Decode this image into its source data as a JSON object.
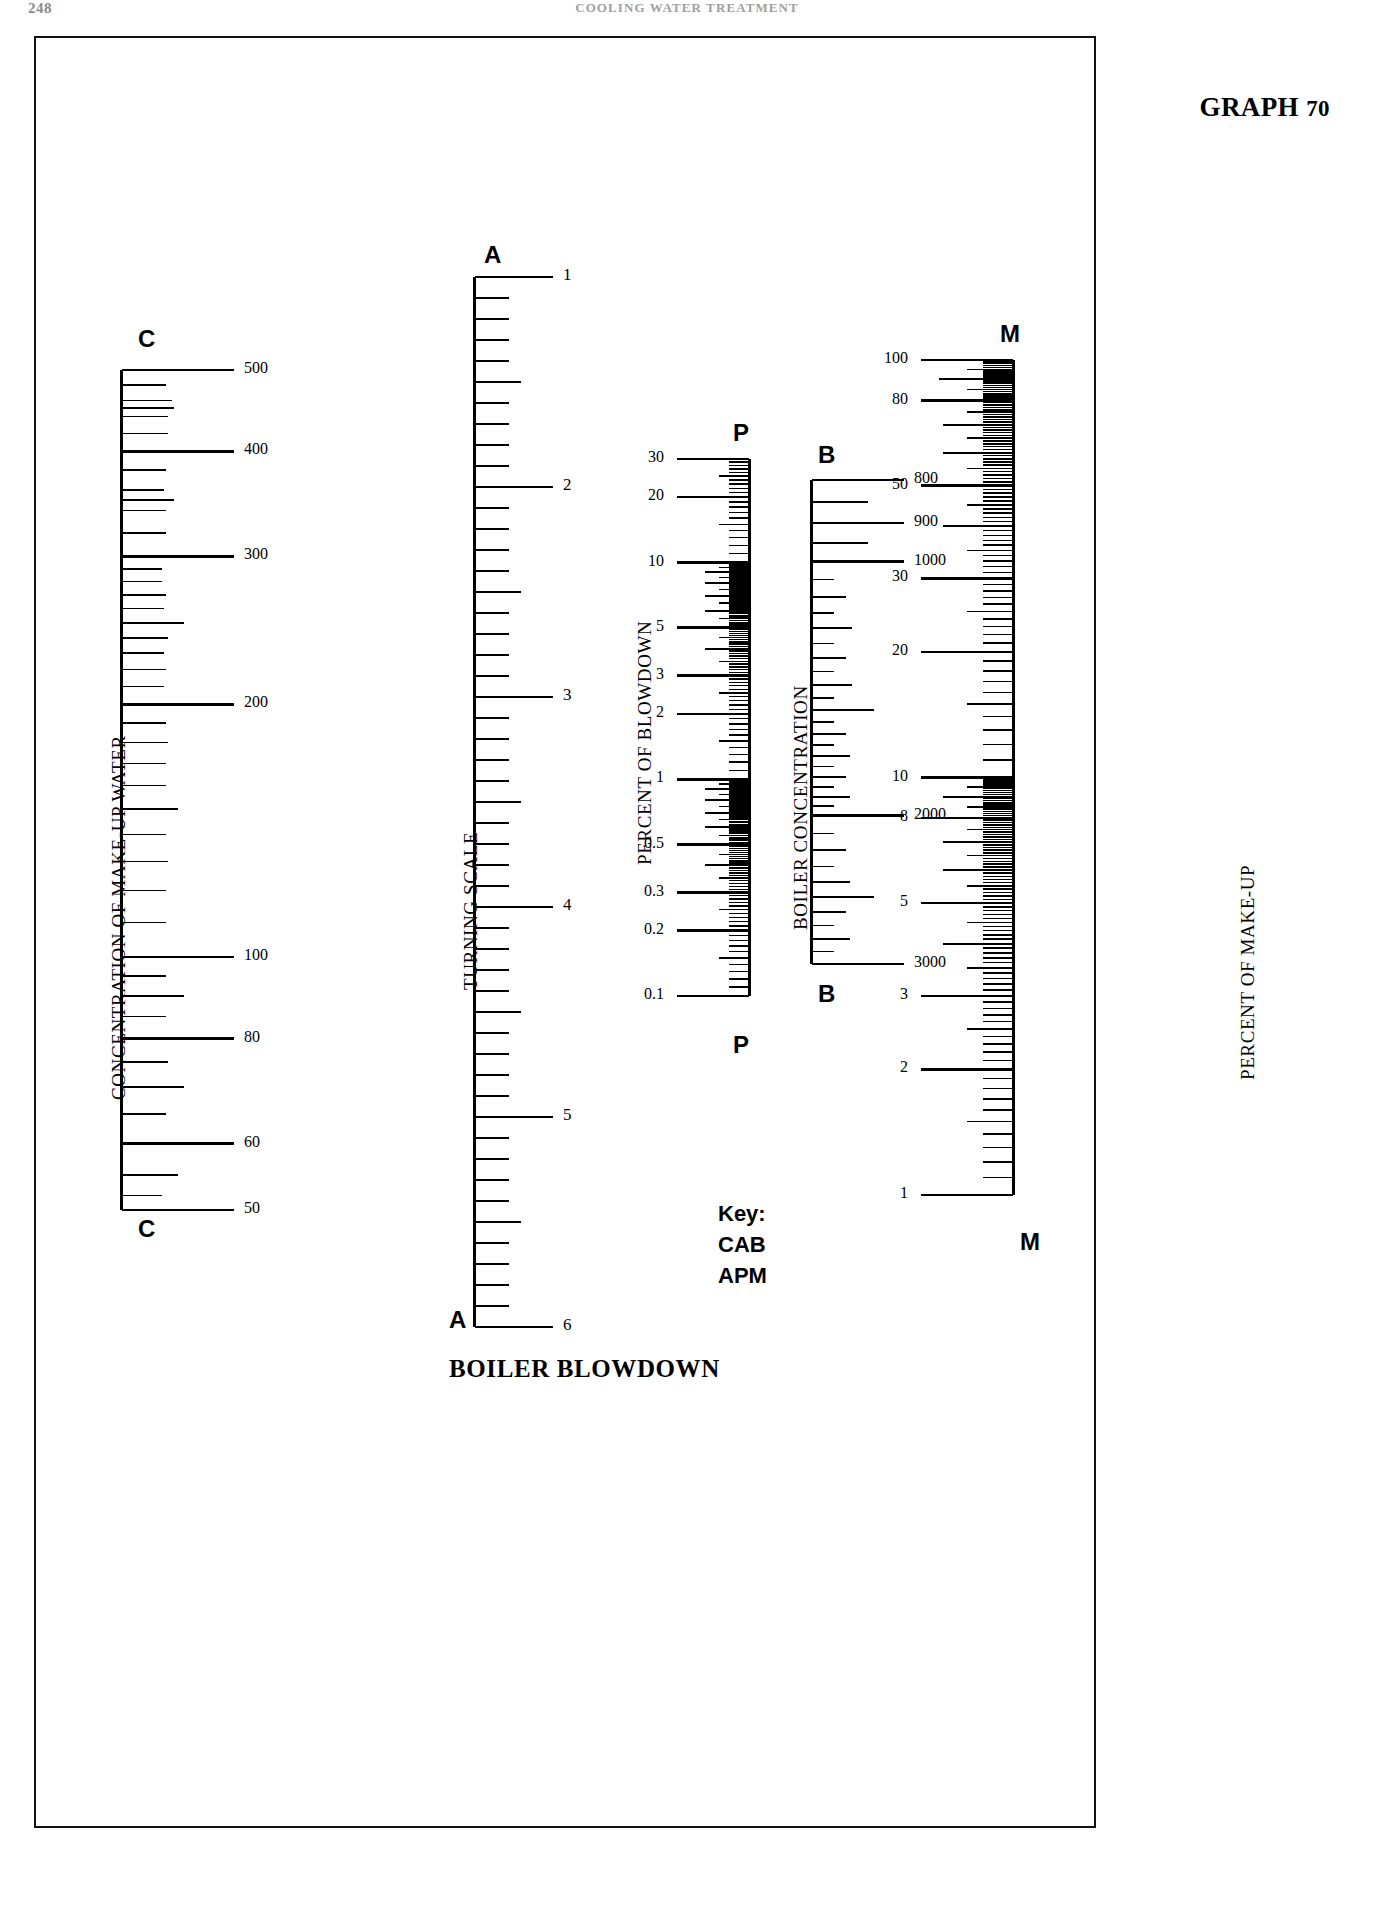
{
  "page": {
    "folio": "248",
    "running_head": "COOLING WATER TREATMENT",
    "graph_label": "GRAPH",
    "graph_number": "70",
    "bottom_title": "BOILER BLOWDOWN",
    "background": "#ffffff",
    "ink": "#000000"
  },
  "key": {
    "title": "Key:",
    "lines": [
      "CAB",
      "APM"
    ]
  },
  "chart_data": {
    "type": "nomogram",
    "subtitle": "Alignment nomogram: C–A–B  and  A–P–M",
    "grid": false,
    "legend_position": "bottom-center",
    "axes": [
      {
        "id": "C",
        "name": "C",
        "axis_label": "CONCENTRATION OF MAKE-UP WATER",
        "top_cap": "C",
        "bottom_cap": "C",
        "scale": "log",
        "direction": "decreasing-downward",
        "range": [
          500,
          50
        ],
        "labels_side": "right",
        "tick_labels": [
          "500",
          "400",
          "300",
          "200",
          "100",
          "80",
          "60",
          "50"
        ],
        "tick_values": [
          500,
          400,
          300,
          200,
          100,
          80,
          60,
          50
        ]
      },
      {
        "id": "A",
        "name": "A",
        "axis_label": "TURNING SCALE",
        "top_cap": "A",
        "bottom_cap": "A",
        "scale": "linear-index",
        "direction": "increasing-downward",
        "range": [
          1,
          6
        ],
        "labels_side": "right",
        "tick_labels": [
          "1",
          "2",
          "3",
          "4",
          "5",
          "6"
        ],
        "tick_values": [
          1,
          2,
          3,
          4,
          5,
          6
        ]
      },
      {
        "id": "P",
        "name": "P",
        "axis_label": "PERCENT OF BLOWDOWN",
        "top_cap": "P",
        "bottom_cap": "P",
        "scale": "log",
        "direction": "decreasing-downward",
        "range": [
          30,
          0.1
        ],
        "labels_side": "left",
        "tick_labels": [
          "30",
          "20",
          "10",
          "5",
          "3",
          "2",
          "1",
          "0.5",
          "0.3",
          "0.2",
          "0.1"
        ],
        "tick_values": [
          30,
          20,
          10,
          5,
          3,
          2,
          1,
          0.5,
          0.3,
          0.2,
          0.1
        ]
      },
      {
        "id": "B",
        "name": "B",
        "axis_label": "BOILER  CONCENTRATION",
        "top_cap": "B",
        "bottom_cap": "B",
        "scale": "log",
        "direction": "increasing-downward",
        "range": [
          800,
          3000
        ],
        "labels_side": "right",
        "tick_labels": [
          "800",
          "900",
          "1000",
          "2000",
          "3000"
        ],
        "tick_values": [
          800,
          900,
          1000,
          2000,
          3000
        ]
      },
      {
        "id": "M",
        "name": "M",
        "axis_label": "PERCENT OF MAKE-UP",
        "top_cap": "M",
        "bottom_cap": "M",
        "scale": "log",
        "direction": "decreasing-downward",
        "range": [
          100,
          1
        ],
        "labels_side": "left",
        "tick_labels": [
          "100",
          "80",
          "50",
          "30",
          "20",
          "10",
          "8",
          "5",
          "3",
          "2",
          "1"
        ],
        "tick_values": [
          100,
          80,
          50,
          30,
          20,
          10,
          8,
          5,
          3,
          2,
          1
        ]
      }
    ]
  }
}
